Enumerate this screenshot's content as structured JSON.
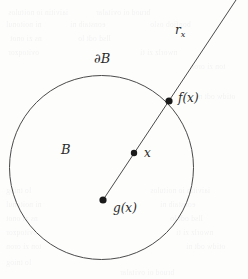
{
  "figure": {
    "canvas": {
      "width": 248,
      "height": 279,
      "background": "#fdfdfc"
    },
    "stroke_color": "#4a4a4a",
    "point_color": "#1a1a1a",
    "circle": {
      "cx": 101.5,
      "cy": 167.5,
      "r": 92,
      "stroke_width": 1
    },
    "ray": {
      "x1": 103,
      "y1": 200,
      "x2": 236,
      "y2": 0,
      "stroke_width": 1
    },
    "points": [
      {
        "name": "f(x)",
        "cx": 169,
        "cy": 101,
        "r": 3.6
      },
      {
        "name": "x",
        "cx": 134,
        "cy": 153,
        "r": 3.2
      },
      {
        "name": "g(x)",
        "cx": 103,
        "cy": 200,
        "r": 3.6
      }
    ],
    "labels": {
      "ray_label": "r",
      "ray_label_sub": "x",
      "boundary_label": "∂B",
      "image_point_label": "f(x)",
      "interior_point_label": "x",
      "center_point_label": "g(x)",
      "ball_label": "B"
    }
  },
  "ghost_text": {
    "note": "faint bleed-through from reverse side of scanned page",
    "lines": [
      "iaivitin io noitulos",
      "bruod oi ovitalar",
      "ni noitonul",
      "eonstaib ni",
      "bonfiob oslo",
      "ns zi onot",
      "llsd odt lo",
      "ovitoqzor",
      "nworlz zi ti",
      "ton zi oron",
      "otidw odt ni",
      "lo tniog"
    ]
  }
}
